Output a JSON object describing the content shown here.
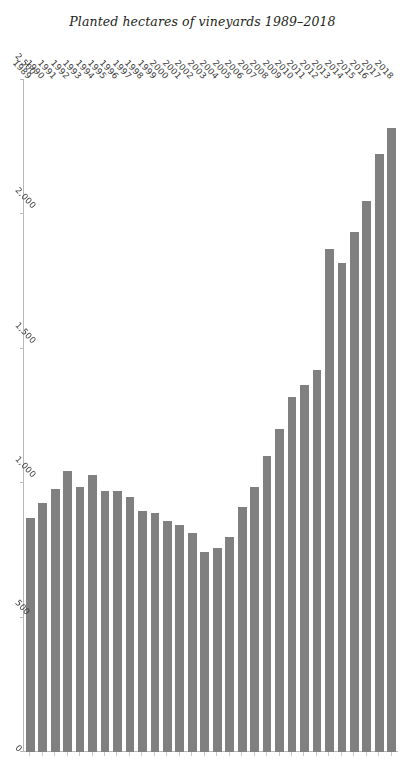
{
  "chart_data": {
    "type": "bar",
    "orientation": "horizontal",
    "title": "",
    "axis_title": "Planted hectares of vineyards 1989–2018",
    "xlabel": "",
    "ylabel": "",
    "bar_color": "#808080",
    "background_color": "#ffffff",
    "grid": false,
    "legend": false,
    "page_rotation_degrees": 90,
    "value_axis": {
      "min": 0,
      "max": 2500,
      "ticks": [
        2500,
        2000,
        1500,
        1000,
        500,
        0
      ],
      "tick_labels": [
        "2,500",
        "2,000",
        "1,500",
        "1,000",
        "500",
        "0"
      ],
      "direction": "descending"
    },
    "categories": [
      "2018",
      "2017",
      "2016",
      "2015",
      "2014",
      "2013",
      "2012",
      "2011",
      "2010",
      "2009",
      "2008",
      "2007",
      "2006",
      "2005",
      "2004",
      "2003",
      "2002",
      "2001",
      "2000",
      "1999",
      "1998",
      "1997",
      "1996",
      "1995",
      "1994",
      "1993",
      "1992",
      "1991",
      "1990",
      "1989"
    ],
    "values": [
      2320,
      2225,
      2050,
      1935,
      1820,
      1870,
      1420,
      1365,
      1320,
      1200,
      1100,
      985,
      910,
      800,
      760,
      745,
      815,
      845,
      860,
      890,
      895,
      950,
      970,
      970,
      1030,
      985,
      1045,
      980,
      925,
      870
    ],
    "units": "hectares"
  }
}
